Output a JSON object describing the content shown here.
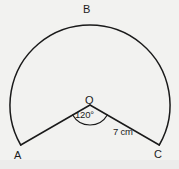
{
  "figure": {
    "type": "geometry-diagram",
    "background_color": "#f2f2f0",
    "stroke_color": "#1a1a1a",
    "labels": {
      "vertex_b": "B",
      "vertex_o": "O",
      "vertex_a": "A",
      "vertex_c": "C",
      "angle": "120°",
      "side_length": "7 cm"
    },
    "geometry": {
      "centre": {
        "x": 90,
        "y": 105
      },
      "radius": 80,
      "point_a": {
        "x": 21,
        "y": 145
      },
      "point_b": {
        "x": 90,
        "y": 25
      },
      "point_c": {
        "x": 159,
        "y": 145
      },
      "minor_angle_degrees": 120,
      "major_arc_degrees": 240,
      "radius_label_value": "7 cm",
      "angle_marker_radius": 20
    }
  }
}
